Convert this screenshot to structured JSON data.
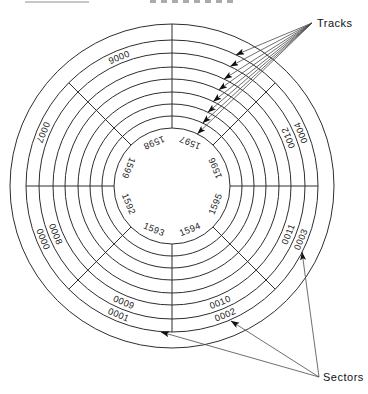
{
  "diagram": {
    "callouts": {
      "tracks": "Tracks",
      "sectors": "Sectors"
    },
    "sector_labels": {
      "outer_track": [
        "0000",
        "0001",
        "0002",
        "0003",
        "0004",
        "0006",
        "0007"
      ],
      "second_track": [
        "0008",
        "0009",
        "0010",
        "0011",
        "0012"
      ],
      "innermost_track": [
        "1592",
        "1593",
        "1594",
        "1595",
        "1596",
        "1597",
        "1598",
        "1599"
      ]
    },
    "counts": {
      "concentric_circles": 9,
      "sector_spokes": 8,
      "tracks_arrows": 8,
      "sectors_arrows": 3
    },
    "colors": {
      "background": "#ffffff",
      "line_ink": "#2e2e2e",
      "label_ink": "#1a1a1a"
    }
  }
}
